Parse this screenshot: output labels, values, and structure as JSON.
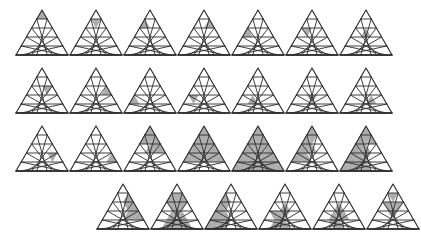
{
  "figure": {
    "canvas": {
      "width": 392,
      "height": 236,
      "background": "#ffffff"
    },
    "style": {
      "stroke_color": "#2b2b2b",
      "stroke_width": 0.9,
      "fill_shaded": "#9d9d9d",
      "fill_empty": "#ffffff",
      "shaded_opacity": 0.85
    },
    "cell_geometry": {
      "subdivisions": 5,
      "tri_width": 52,
      "tri_height": 45,
      "note": "Unit triangles indexed row r (0=apex .. 4=base), then left-to-right position p; upward triangles at even p, downward at odd p."
    },
    "rows": [
      {
        "row_index": 0,
        "y": 8,
        "x_start": 14,
        "x_step": 54,
        "count": 7,
        "items": [
          {
            "id": "r1c1",
            "label": "1-1",
            "shaded": [
              [
                0,
                0
              ]
            ]
          },
          {
            "id": "r1c2",
            "label": "1-2",
            "shaded": [
              [
                1,
                1
              ]
            ]
          },
          {
            "id": "r1c3",
            "label": "1-3",
            "shaded": [
              [
                1,
                0
              ]
            ]
          },
          {
            "id": "r1c4",
            "label": "1-4",
            "shaded": [
              [
                1,
                2
              ]
            ]
          },
          {
            "id": "r1c5",
            "label": "1-5",
            "shaded": [
              [
                2,
                0
              ]
            ]
          },
          {
            "id": "r1c6",
            "label": "1-6",
            "shaded": [
              [
                2,
                1
              ]
            ]
          },
          {
            "id": "r1c7",
            "label": "1-7",
            "shaded": [
              [
                2,
                2
              ]
            ]
          }
        ]
      },
      {
        "row_index": 1,
        "y": 66,
        "x_start": 14,
        "x_step": 54,
        "count": 7,
        "items": [
          {
            "id": "r2c1",
            "label": "2-1",
            "shaded": [
              [
                2,
                3
              ]
            ]
          },
          {
            "id": "r2c2",
            "label": "2-2",
            "shaded": [
              [
                2,
                4
              ]
            ]
          },
          {
            "id": "r2c3",
            "label": "2-3",
            "shaded": [
              [
                3,
                0
              ]
            ]
          },
          {
            "id": "r2c4",
            "label": "2-4",
            "shaded": [
              [
                3,
                1
              ]
            ]
          },
          {
            "id": "r2c5",
            "label": "2-5",
            "shaded": [
              [
                3,
                2
              ]
            ]
          },
          {
            "id": "r2c6",
            "label": "2-6",
            "shaded": [
              [
                3,
                3
              ]
            ]
          },
          {
            "id": "r2c7",
            "label": "2-7",
            "shaded": [
              [
                3,
                4
              ]
            ]
          }
        ]
      },
      {
        "row_index": 2,
        "y": 124,
        "x_start": 14,
        "x_step": 54,
        "count": 7,
        "items": [
          {
            "id": "r3c1",
            "label": "3-1",
            "shaded": [
              [
                3,
                5
              ]
            ]
          },
          {
            "id": "r3c2",
            "label": "3-2",
            "shaded": [
              [
                3,
                6
              ]
            ]
          },
          {
            "id": "r3c3",
            "label": "3-3",
            "shaded": [
              [
                0,
                0
              ],
              [
                1,
                0
              ],
              [
                1,
                1
              ],
              [
                1,
                2
              ],
              [
                2,
                2
              ],
              [
                2,
                3
              ],
              [
                2,
                4
              ]
            ]
          },
          {
            "id": "r3c4",
            "label": "3-4",
            "shaded": [
              [
                0,
                0
              ],
              [
                1,
                0
              ],
              [
                1,
                1
              ],
              [
                1,
                2
              ],
              [
                2,
                0
              ],
              [
                2,
                1
              ],
              [
                2,
                2
              ],
              [
                2,
                3
              ],
              [
                2,
                4
              ],
              [
                3,
                0
              ],
              [
                3,
                1
              ],
              [
                3,
                2
              ],
              [
                3,
                3
              ],
              [
                3,
                4
              ],
              [
                3,
                5
              ],
              [
                3,
                6
              ]
            ]
          },
          {
            "id": "r3c5",
            "label": "3-5",
            "shaded": [
              [
                0,
                0
              ],
              [
                1,
                0
              ],
              [
                1,
                1
              ],
              [
                1,
                2
              ],
              [
                2,
                0
              ],
              [
                2,
                1
              ],
              [
                2,
                2
              ],
              [
                2,
                3
              ],
              [
                2,
                4
              ],
              [
                3,
                0
              ],
              [
                3,
                1
              ],
              [
                3,
                2
              ],
              [
                3,
                3
              ],
              [
                3,
                4
              ],
              [
                3,
                5
              ],
              [
                3,
                6
              ],
              [
                4,
                0
              ],
              [
                4,
                1
              ],
              [
                4,
                2
              ],
              [
                4,
                3
              ],
              [
                4,
                4
              ],
              [
                4,
                5
              ],
              [
                4,
                6
              ],
              [
                4,
                7
              ],
              [
                4,
                8
              ]
            ]
          },
          {
            "id": "r3c6",
            "label": "3-6",
            "shaded": [
              [
                0,
                0
              ],
              [
                1,
                0
              ],
              [
                1,
                1
              ],
              [
                2,
                0
              ],
              [
                2,
                1
              ],
              [
                2,
                2
              ],
              [
                3,
                0
              ],
              [
                3,
                1
              ],
              [
                3,
                2
              ]
            ]
          },
          {
            "id": "r3c7",
            "label": "3-7",
            "shaded": [
              [
                0,
                0
              ],
              [
                1,
                0
              ],
              [
                1,
                1
              ],
              [
                1,
                2
              ],
              [
                2,
                0
              ],
              [
                2,
                1
              ],
              [
                2,
                2
              ],
              [
                3,
                0
              ],
              [
                3,
                1
              ],
              [
                3,
                2
              ],
              [
                3,
                3
              ],
              [
                4,
                0
              ],
              [
                4,
                1
              ],
              [
                4,
                2
              ],
              [
                4,
                3
              ],
              [
                4,
                4
              ]
            ]
          }
        ]
      },
      {
        "row_index": 3,
        "y": 182,
        "x_start": 95,
        "x_step": 54,
        "count": 6,
        "items": [
          {
            "id": "r4c1",
            "label": "4-1",
            "shaded": [
              [
                1,
                2
              ],
              [
                2,
                3
              ],
              [
                2,
                4
              ],
              [
                3,
                4
              ],
              [
                3,
                5
              ],
              [
                3,
                6
              ]
            ]
          },
          {
            "id": "r4c2",
            "label": "4-2",
            "shaded": [
              [
                1,
                0
              ],
              [
                1,
                1
              ],
              [
                1,
                2
              ],
              [
                2,
                1
              ],
              [
                2,
                2
              ],
              [
                2,
                3
              ],
              [
                3,
                2
              ],
              [
                3,
                3
              ],
              [
                3,
                4
              ],
              [
                4,
                2
              ],
              [
                4,
                3
              ],
              [
                4,
                4
              ],
              [
                4,
                5
              ],
              [
                4,
                6
              ]
            ]
          },
          {
            "id": "r4c3",
            "label": "4-3",
            "shaded": [
              [
                1,
                0
              ],
              [
                2,
                0
              ],
              [
                2,
                1
              ],
              [
                3,
                0
              ],
              [
                3,
                1
              ],
              [
                3,
                2
              ],
              [
                4,
                0
              ],
              [
                4,
                1
              ],
              [
                4,
                2
              ],
              [
                4,
                3
              ]
            ]
          },
          {
            "id": "r4c4",
            "label": "4-4",
            "shaded": [
              [
                2,
                2
              ],
              [
                3,
                1
              ],
              [
                3,
                2
              ],
              [
                3,
                3
              ],
              [
                4,
                2
              ],
              [
                4,
                3
              ],
              [
                4,
                4
              ]
            ]
          },
          {
            "id": "r4c5",
            "label": "4-5",
            "shaded": [
              [
                2,
                2
              ],
              [
                3,
                2
              ],
              [
                3,
                3
              ],
              [
                3,
                4
              ],
              [
                4,
                3
              ],
              [
                4,
                4
              ]
            ]
          },
          {
            "id": "r4c6",
            "label": "4-6",
            "shaded": [
              [
                1,
                1
              ],
              [
                2,
                1
              ],
              [
                2,
                2
              ],
              [
                2,
                3
              ],
              [
                3,
                3
              ]
            ]
          }
        ]
      }
    ]
  }
}
